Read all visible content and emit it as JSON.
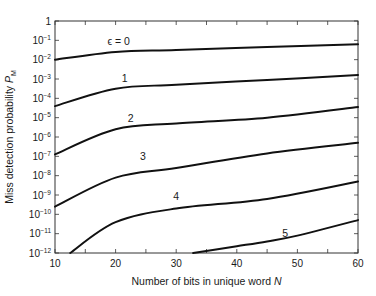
{
  "chart_data": {
    "type": "line",
    "title": "",
    "xlabel": "Number of bits in unique word N",
    "ylabel": "Miss detection probability P_M",
    "xlabel_parts": {
      "text": "Number of bits in unique word ",
      "var": "N"
    },
    "ylabel_parts": {
      "text": "Miss detection probability ",
      "var": "P",
      "sub": "M"
    },
    "xlim": [
      10,
      60
    ],
    "ylim_log10": [
      -12,
      0
    ],
    "yscale": "log",
    "grid": false,
    "legend": "none (inline curve labels)",
    "x_ticks": [
      10,
      20,
      30,
      40,
      50,
      60
    ],
    "x_minor_ticks": [
      15,
      25,
      35,
      45,
      55
    ],
    "y_tick_labels": [
      "1",
      "10^-1",
      "10^-2",
      "10^-3",
      "10^-4",
      "10^-5",
      "10^-6",
      "10^-7",
      "10^-8",
      "10^-9",
      "10^-10",
      "10^-11",
      "10^-12"
    ],
    "y_tick_exponents": [
      0,
      -1,
      -2,
      -3,
      -4,
      -5,
      -6,
      -7,
      -8,
      -9,
      -10,
      -11,
      -12
    ],
    "series": [
      {
        "name": "ε = 0",
        "label": "ϵ = 0",
        "label_pos": [
          20.5,
          -1.05
        ],
        "x": [
          10,
          20,
          30,
          45,
          60
        ],
        "log10_y": [
          -2.0,
          -1.6,
          -1.5,
          -1.35,
          -1.2
        ]
      },
      {
        "name": "ε = 1",
        "label": "1",
        "label_pos": [
          21.5,
          -2.95
        ],
        "x": [
          10,
          20,
          30,
          45,
          60
        ],
        "log10_y": [
          -4.4,
          -3.5,
          -3.3,
          -3.05,
          -2.8
        ]
      },
      {
        "name": "ε = 2",
        "label": "2",
        "label_pos": [
          22.5,
          -5.0
        ],
        "x": [
          10,
          20,
          30,
          45,
          60
        ],
        "log10_y": [
          -6.9,
          -5.6,
          -5.3,
          -5.0,
          -4.45
        ]
      },
      {
        "name": "ε = 3",
        "label": "3",
        "label_pos": [
          24.5,
          -7.0
        ],
        "x": [
          10,
          20,
          30,
          45,
          60
        ],
        "log10_y": [
          -9.6,
          -8.1,
          -7.6,
          -6.85,
          -6.3
        ]
      },
      {
        "name": "ε = 4",
        "label": "4",
        "label_pos": [
          30.0,
          -9.05
        ],
        "x": [
          12.5,
          20,
          30,
          45,
          60
        ],
        "log10_y": [
          -12.0,
          -10.4,
          -9.7,
          -9.2,
          -8.3
        ]
      },
      {
        "name": "ε = 5",
        "label": "5",
        "label_pos": [
          48.0,
          -10.95
        ],
        "x": [
          32.8,
          40,
          45,
          50,
          60
        ],
        "log10_y": [
          -12.0,
          -11.65,
          -11.4,
          -11.1,
          -10.3
        ]
      }
    ]
  },
  "plot_frame": {
    "left": 55,
    "right": 358,
    "top": 21,
    "bottom": 253
  }
}
